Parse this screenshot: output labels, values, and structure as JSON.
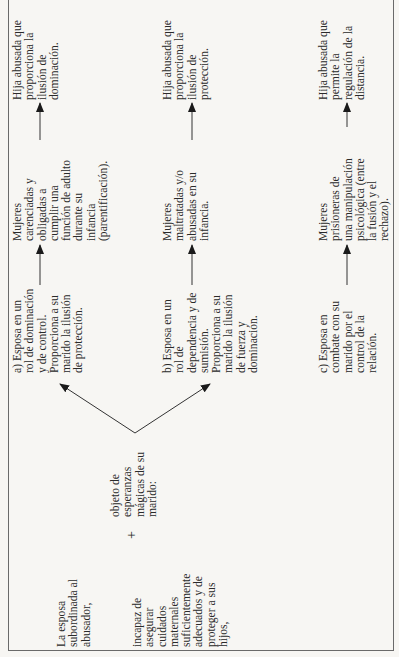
{
  "source": {
    "line1": "La esposa\nsubordinada al\nabusador,",
    "line2": "incapaz de\nasegurar\ncuidados\nmaternales\nsuficientemente\nadecuados y de\nproteger a sus\nhijos,",
    "plus": "+",
    "hope": "objeto de\nesperanzas\nmágicas de su\nmarido:"
  },
  "branches": [
    {
      "role": "a) Esposa en un\nrol de dominación\ny de control.\nProporciona a su\nmarido la ilusión\nde protección.",
      "mother": "Mujeres\ncarenciadas y\nobligadas a\ncumplir una\nfunción de adulto\ndurante su\ninfancia\n(parentificación).",
      "daughter": "Hija abusada que\nproporciona la\nilusión de\ndominación."
    },
    {
      "role": "b) Esposa en un\nrol de\ndependencia y de\nsumisión.\nProporciona a su\nmarido la ilusión\nde fuerza y\ndominación.",
      "mother": "Mujeres\nmaltratadas y/o\nabusadas en su\ninfancia.",
      "daughter": "Hija abusada que\nproporciona la\nilusión de\nprotección."
    },
    {
      "role": "c) Esposa en\ncombate con su\nmarido por el\ncontrol de la\nrelación.",
      "mother": "Mujeres\nprisioneras de\nuna manipulación\npsicológica (entre\nla fusión y el\nrechazo).",
      "daughter": "Hija abusada que\npermite la\nregulación de la\ndistancia."
    }
  ],
  "colors": {
    "ink": "#2a2a2a",
    "paper": "#f7f6f3",
    "border": "#6a6a6a"
  }
}
